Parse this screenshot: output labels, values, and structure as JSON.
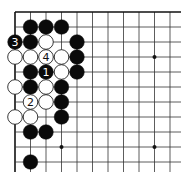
{
  "diagram": {
    "type": "go-board-fragment",
    "grid": {
      "origin_x": 15,
      "origin_y": 12,
      "spacing_x": 15.5,
      "spacing_y": 15,
      "cols": 12,
      "rows": 11,
      "right_extent": 181,
      "bottom_extent": 172,
      "edges": [
        "top",
        "left"
      ]
    },
    "star_points": [
      {
        "col": 9,
        "row": 3
      },
      {
        "col": 3,
        "row": 9
      },
      {
        "col": 9,
        "row": 9
      }
    ],
    "stones": [
      {
        "color": "black",
        "col": 1,
        "row": 1
      },
      {
        "color": "black",
        "col": 2,
        "row": 1
      },
      {
        "color": "black",
        "col": 3,
        "row": 1
      },
      {
        "color": "black",
        "col": 0,
        "row": 2,
        "label": "3"
      },
      {
        "color": "black",
        "col": 1,
        "row": 2
      },
      {
        "color": "white",
        "col": 2,
        "row": 2
      },
      {
        "color": "black",
        "col": 4,
        "row": 2
      },
      {
        "color": "white",
        "col": 0,
        "row": 3
      },
      {
        "color": "white",
        "col": 1,
        "row": 3
      },
      {
        "color": "white",
        "col": 2,
        "row": 3,
        "label": "4"
      },
      {
        "color": "white",
        "col": 3,
        "row": 3
      },
      {
        "color": "black",
        "col": 4,
        "row": 3
      },
      {
        "color": "black",
        "col": 1,
        "row": 4
      },
      {
        "color": "black",
        "col": 2,
        "row": 4,
        "label": "1"
      },
      {
        "color": "white",
        "col": 3,
        "row": 4
      },
      {
        "color": "black",
        "col": 4,
        "row": 4
      },
      {
        "color": "white",
        "col": 0,
        "row": 5
      },
      {
        "color": "black",
        "col": 1,
        "row": 5
      },
      {
        "color": "white",
        "col": 2,
        "row": 5
      },
      {
        "color": "black",
        "col": 3,
        "row": 5
      },
      {
        "color": "white",
        "col": 1,
        "row": 6,
        "label": "2"
      },
      {
        "color": "white",
        "col": 2,
        "row": 6
      },
      {
        "color": "black",
        "col": 3,
        "row": 6
      },
      {
        "color": "white",
        "col": 0,
        "row": 7
      },
      {
        "color": "white",
        "col": 1,
        "row": 7
      },
      {
        "color": "black",
        "col": 3,
        "row": 7
      },
      {
        "color": "black",
        "col": 1,
        "row": 8
      },
      {
        "color": "black",
        "col": 2,
        "row": 8
      },
      {
        "color": "black",
        "col": 1,
        "row": 10
      }
    ],
    "colors": {
      "line": "#333333",
      "edge": "#111111",
      "black_stone": "#0a0a0a",
      "white_stone": "#ffffff",
      "white_outline": "#222222"
    }
  }
}
